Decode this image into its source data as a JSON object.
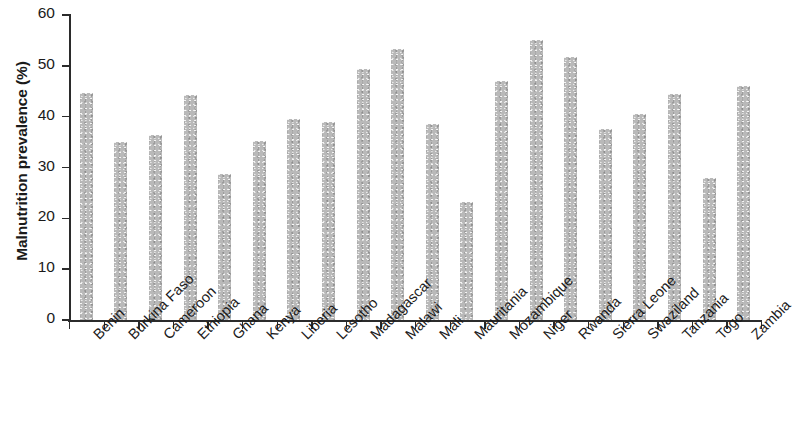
{
  "chart_data": {
    "type": "bar",
    "title": "",
    "xlabel": "",
    "ylabel": "Malnutrition prevalence (%)",
    "ylim": [
      0,
      60
    ],
    "yticks": [
      0,
      10,
      20,
      30,
      40,
      50,
      60
    ],
    "grid": false,
    "legend": null,
    "bar_color": "#b9b9b9",
    "axis_color": "#2b2b2b",
    "categories": [
      "Benin",
      "Burkina Faso",
      "Cameroon",
      "Ethiopia",
      "Ghana",
      "Kenya",
      "Liberia",
      "Lesotho",
      "Madagascar",
      "Malawi",
      "Mali",
      "Mauritania",
      "Mozambique",
      "Niger",
      "Rwanda",
      "Sierra Leone",
      "Swaziland",
      "Tanzania",
      "Togo",
      "Zambia"
    ],
    "values": [
      44.6,
      35.0,
      36.4,
      44.2,
      28.8,
      35.3,
      39.5,
      39.0,
      49.4,
      53.3,
      38.5,
      23.2,
      47.1,
      55.0,
      51.8,
      37.5,
      40.6,
      44.5,
      28.0,
      46.1
    ]
  }
}
